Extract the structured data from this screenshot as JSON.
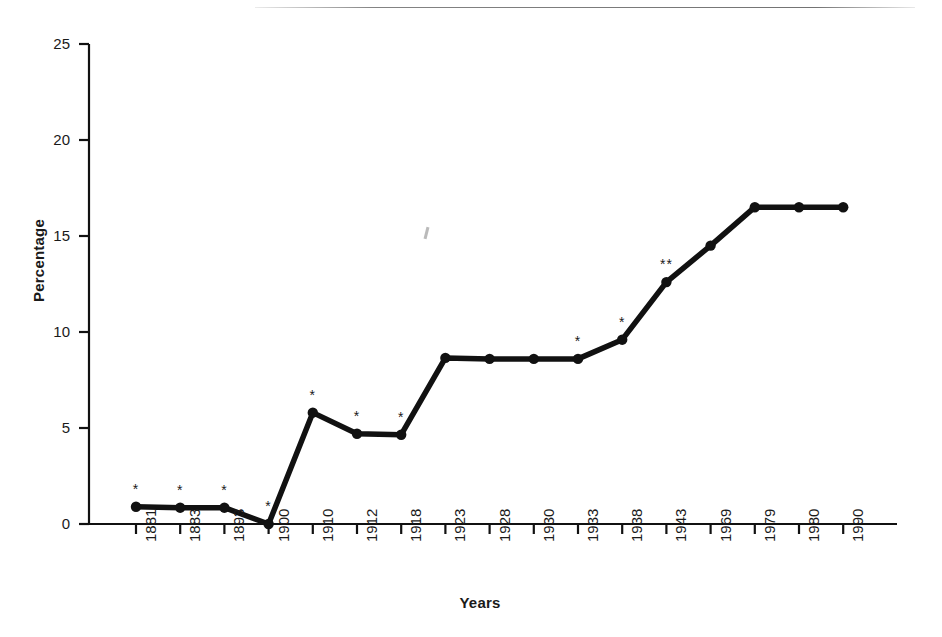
{
  "figure": {
    "x_axis_title": "Years",
    "y_axis_title": "Percentage",
    "page_rule": "page-rule-top",
    "artifact": "scan-artifact-mark"
  },
  "chart_data": {
    "type": "line",
    "title": "",
    "subtitle": "",
    "xlabel": "Years",
    "ylabel": "Percentage",
    "categories": [
      "1881",
      "1883",
      "1893",
      "1900",
      "1910",
      "1912",
      "1918",
      "1923",
      "1928",
      "1930",
      "1933",
      "1938",
      "1943",
      "1969",
      "1979",
      "1980",
      "1990"
    ],
    "values": [
      0.9,
      0.85,
      0.85,
      0.0,
      5.8,
      4.7,
      4.65,
      8.65,
      8.6,
      8.6,
      8.6,
      9.6,
      12.6,
      14.5,
      16.5,
      16.5,
      16.5
    ],
    "annotations": [
      "*",
      "*",
      "*",
      "*",
      "*",
      "*",
      "*",
      "",
      "",
      "",
      "*",
      "*",
      "**",
      "",
      "",
      "",
      ""
    ],
    "ylim": [
      0,
      25
    ],
    "yticks": [
      0,
      5,
      10,
      15,
      20,
      25
    ],
    "ytick_labels": [
      "0",
      "5",
      "10",
      "15",
      "20",
      "25"
    ],
    "grid": false,
    "legend": "none",
    "marker": "filled-circle",
    "line_color": "#111111",
    "marker_color": "#111111",
    "background_color": "#ffffff"
  }
}
